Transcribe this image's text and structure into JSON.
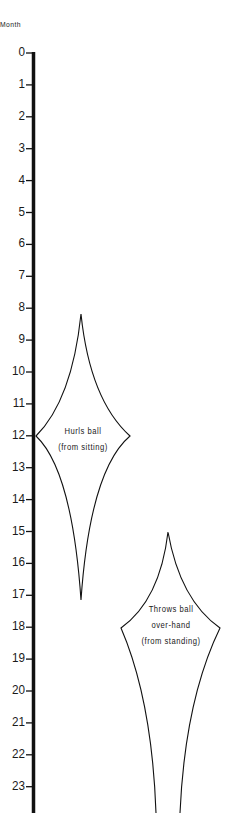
{
  "axis": {
    "title": "Month",
    "ticks": [
      "0",
      "1",
      "2",
      "3",
      "4",
      "5",
      "6",
      "7",
      "8",
      "9",
      "10",
      "11",
      "12",
      "13",
      "14",
      "15",
      "16",
      "17",
      "18",
      "19",
      "20",
      "21",
      "22",
      "23"
    ]
  },
  "shapes": [
    {
      "label_lines": [
        "Hurls ball",
        "(from sitting)"
      ],
      "start_month": 9,
      "peak_month": 12,
      "end_month": 18
    },
    {
      "label_lines": [
        "Throws ball",
        "over-hand",
        "(from standing)"
      ],
      "start_month": 15,
      "peak_month": 18,
      "end_month": "24+"
    }
  ]
}
